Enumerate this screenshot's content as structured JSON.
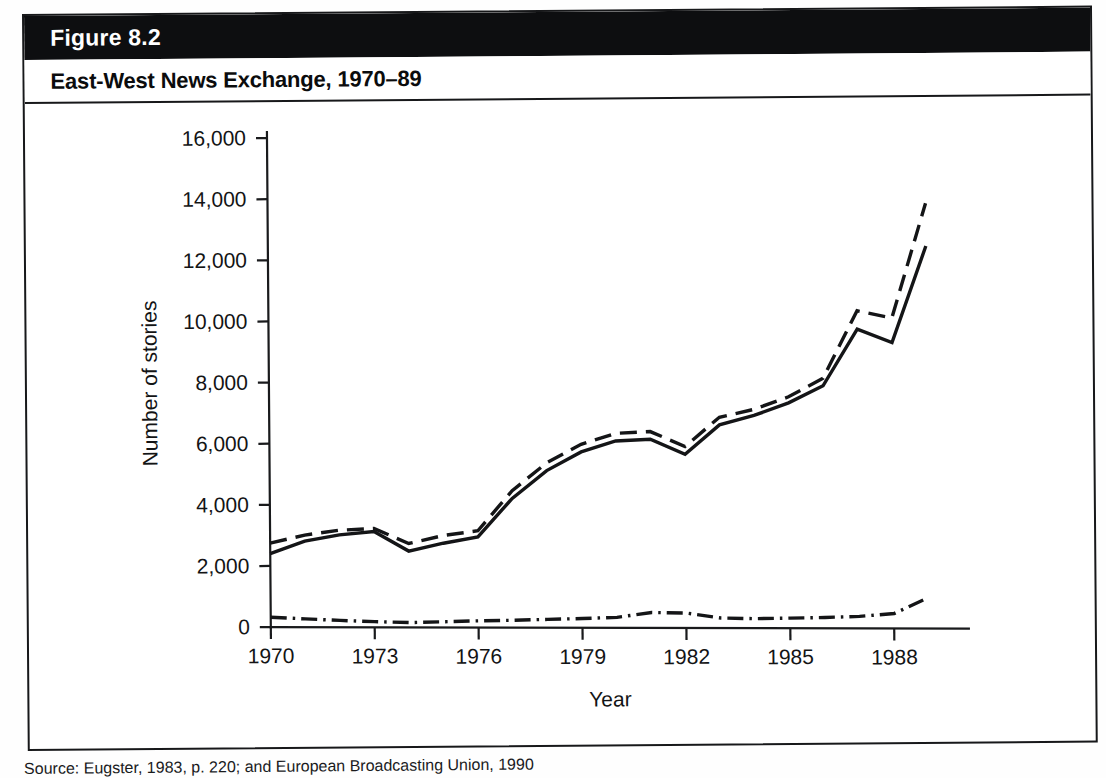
{
  "figure": {
    "label": "Figure 8.2",
    "title": "East-West News Exchange, 1970–89",
    "source": "Source: Eugster, 1983, p. 220; and European Broadcasting Union, 1990"
  },
  "chart_data": {
    "type": "line",
    "title": "East-West News Exchange, 1970–89",
    "xlabel": "Year",
    "ylabel": "Number of stories",
    "xlim": [
      1970,
      1989
    ],
    "ylim": [
      0,
      16000
    ],
    "xticks": [
      "1970",
      "1973",
      "1976",
      "1979",
      "1982",
      "1985",
      "1988"
    ],
    "xtick_values": [
      1970,
      1973,
      1976,
      1979,
      1982,
      1985,
      1988
    ],
    "yticks": [
      "0",
      "2,000",
      "4,000",
      "6,000",
      "8,000",
      "10,000",
      "12,000",
      "14,000",
      "16,000"
    ],
    "ytick_values": [
      0,
      2000,
      4000,
      6000,
      8000,
      10000,
      12000,
      14000,
      16000
    ],
    "grid": false,
    "legend_position": "bottom",
    "x": [
      1970,
      1971,
      1972,
      1973,
      1974,
      1975,
      1976,
      1977,
      1978,
      1979,
      1980,
      1981,
      1982,
      1983,
      1984,
      1985,
      1986,
      1987,
      1988,
      1989
    ],
    "series": [
      {
        "name": "Combined",
        "style": "dashed",
        "values": [
          2750,
          3000,
          3150,
          3200,
          2700,
          2950,
          3100,
          4400,
          5300,
          5900,
          6250,
          6300,
          5800,
          6750,
          7000,
          7400,
          8000,
          10200,
          9950,
          13700
        ]
      },
      {
        "name": "Intervision",
        "style": "dash-dot",
        "values": [
          320,
          260,
          200,
          150,
          110,
          130,
          150,
          160,
          180,
          200,
          230,
          380,
          350,
          180,
          150,
          160,
          170,
          200,
          280,
          800
        ]
      },
      {
        "name": "Eurovision",
        "style": "solid",
        "values": [
          2400,
          2800,
          3000,
          3100,
          2450,
          2700,
          2900,
          4150,
          5050,
          5650,
          6000,
          6050,
          5550,
          6500,
          6800,
          7200,
          7750,
          9600,
          9150,
          12300
        ]
      }
    ]
  },
  "legend": {
    "items": [
      {
        "label": "Combined",
        "style": "dashed"
      },
      {
        "label": "Intervision",
        "style": "dash-dot"
      },
      {
        "label": "Eurovision",
        "style": "solid"
      }
    ]
  }
}
